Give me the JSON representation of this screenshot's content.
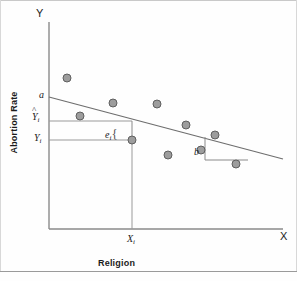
{
  "figure": {
    "type": "scatter-with-regression-line",
    "background_color": "#fefefe",
    "ink_color": "#707070"
  },
  "axes": {
    "y_axis_letter": "Y",
    "x_axis_letter": "X",
    "y_axis_title": "Abortion Rate",
    "x_axis_title": "Religion",
    "origin_px": [
      49,
      229
    ],
    "x_axis_end_px": [
      283,
      229
    ],
    "y_axis_top_px": [
      49,
      22
    ]
  },
  "annotations": {
    "intercept_label": "a",
    "predicted_label": "Y",
    "predicted_sub": "i",
    "predicted_hat": "^",
    "observed_label": "Y",
    "observed_sub": "i",
    "residual_label": "e",
    "residual_sub": "i",
    "residual_brace": "{",
    "slope_label": "b",
    "x_tick_label": "X",
    "x_tick_sub": "i"
  },
  "chart_data": {
    "type": "scatter",
    "title": "",
    "xlabel": "Religion",
    "ylabel": "Abortion Rate",
    "grid": false,
    "legend": null,
    "axis_letters": {
      "x": "X",
      "y": "Y"
    },
    "xlim_px": [
      49,
      283
    ],
    "ylim_px": [
      229,
      22
    ],
    "points_px": [
      [
        67,
        78
      ],
      [
        80,
        116
      ],
      [
        113,
        103
      ],
      [
        132,
        140
      ],
      [
        157,
        104
      ],
      [
        168,
        155
      ],
      [
        186,
        125
      ],
      [
        215,
        135
      ],
      [
        201,
        150
      ],
      [
        236,
        164
      ]
    ],
    "highlighted_point_px": [
      132,
      140
    ],
    "regression_line_px": {
      "x1": 49,
      "y1": 97,
      "x2": 283,
      "y2": 159
    },
    "intercept_marker_px": [
      49,
      97
    ],
    "predicted_y_px": 121,
    "observed_y_px": 140,
    "residual_segment_px": {
      "x": 132,
      "y_top": 121,
      "y_bottom": 140
    },
    "drop_line_px": {
      "x": 132,
      "y_top": 140,
      "y_bottom": 229
    },
    "horizontal_guide_predicted_px": {
      "x1": 49,
      "x2": 132,
      "y": 121
    },
    "horizontal_guide_observed_px": {
      "x1": 49,
      "x2": 132,
      "y": 140
    },
    "slope_triangle_px": {
      "vertical": {
        "x": 205,
        "y1": 137,
        "y2": 160
      },
      "horizontal": {
        "x1": 205,
        "x2": 248,
        "y": 160
      },
      "hypotenuse": {
        "x1": 205,
        "y1": 137,
        "x2": 248,
        "y2": 148
      }
    }
  }
}
